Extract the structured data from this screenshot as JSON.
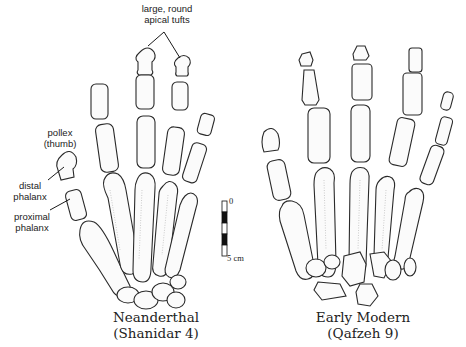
{
  "figure": {
    "panels": [
      {
        "id": "neanderthal",
        "caption_line1": "Neanderthal",
        "caption_line2": "(Shanidar 4)"
      },
      {
        "id": "early-modern",
        "caption_line1": "Early Modern",
        "caption_line2": "(Qafzeh 9)"
      }
    ],
    "annotations": {
      "apical_tufts_line1": "large, round",
      "apical_tufts_line2": "apical tufts",
      "pollex_line1": "pollex",
      "pollex_line2": "(thumb)",
      "distal_line1": "distal",
      "distal_line2": "phalanx",
      "proximal_line1": "proximal",
      "proximal_line2": "phalanx"
    },
    "scale_bar": {
      "top_label": "0",
      "bottom_label": "5 cm",
      "colors": [
        "#ffffff",
        "#111111",
        "#ffffff",
        "#111111",
        "#ffffff"
      ]
    }
  }
}
